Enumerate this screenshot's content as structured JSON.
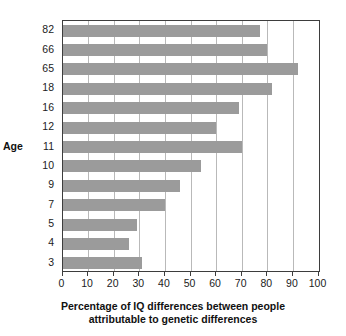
{
  "chart_data": {
    "type": "bar",
    "orientation": "horizontal",
    "title": "",
    "xlabel_line1": "Percentage of IQ differences between people",
    "xlabel_line2": "attributable to genetic differences",
    "ylabel": "Age",
    "categories": [
      "82",
      "66",
      "65",
      "18",
      "16",
      "12",
      "11",
      "10",
      "9",
      "7",
      "5",
      "4",
      "3"
    ],
    "values": [
      77,
      80,
      92,
      82,
      69,
      60,
      70,
      54,
      46,
      40,
      29,
      26,
      31
    ],
    "xlim": [
      0,
      100
    ],
    "xticks": [
      "0",
      "10",
      "20",
      "30",
      "40",
      "50",
      "60",
      "70",
      "80",
      "90",
      "100"
    ],
    "grid": "vertical",
    "legend": "none",
    "bar_color": "#9b9b9b",
    "axis_color": "#3d3d3d",
    "grid_color": "#b9b9b9",
    "background": "#ffffff"
  }
}
